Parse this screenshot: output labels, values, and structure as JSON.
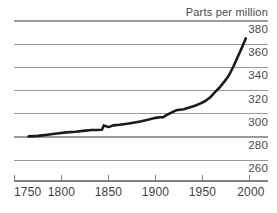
{
  "chart_data": {
    "type": "line",
    "title": "",
    "ylabel": "Parts per million",
    "xlabel": "",
    "xlim": [
      1750,
      2000
    ],
    "ylim": [
      255,
      385
    ],
    "grid": true,
    "legend": "none",
    "y_ticks": [
      380,
      360,
      340,
      320,
      300,
      280,
      260
    ],
    "x_ticks": [
      1750,
      1800,
      1850,
      1900,
      1950,
      2000
    ],
    "series": [
      {
        "name": "Parts per million",
        "color": "#1a1a1a",
        "x": [
          1765,
          1775,
          1785,
          1795,
          1805,
          1815,
          1825,
          1832,
          1838,
          1843,
          1845,
          1850,
          1855,
          1862,
          1870,
          1878,
          1885,
          1893,
          1900,
          1905,
          1908,
          1912,
          1918,
          1922,
          1926,
          1930,
          1936,
          1942,
          1948,
          1953,
          1958,
          1963,
          1968,
          1973,
          1978,
          1983,
          1988,
          1993,
          1996
        ],
        "values": [
          280.5,
          281.0,
          282.0,
          283.0,
          284.0,
          284.5,
          285.5,
          286.0,
          286.0,
          286.2,
          290.0,
          288.5,
          290.0,
          290.5,
          291.5,
          292.5,
          293.5,
          295.0,
          296.5,
          297.0,
          297.0,
          299.0,
          301.5,
          303.0,
          303.5,
          304.0,
          305.5,
          307.0,
          309.0,
          311.0,
          314.0,
          318.5,
          322.5,
          327.5,
          333.0,
          341.0,
          350.0,
          359.0,
          365.0
        ]
      }
    ]
  },
  "axis": {
    "title_label": "Parts per million"
  },
  "y_labels": {
    "t0": "380",
    "t1": "360",
    "t2": "340",
    "t3": "320",
    "t4": "300",
    "t5": "280",
    "t6": "260"
  },
  "x_labels": {
    "t0": "1750",
    "t1": "1800",
    "t2": "1850",
    "t3": "1900",
    "t4": "1950",
    "t5": "2000"
  },
  "colors": {
    "line": "#1a1a1a",
    "grid": "#9a9a9a",
    "axis": "#7f7f7f",
    "text": "#4a4a4a",
    "background": "#ffffff"
  }
}
